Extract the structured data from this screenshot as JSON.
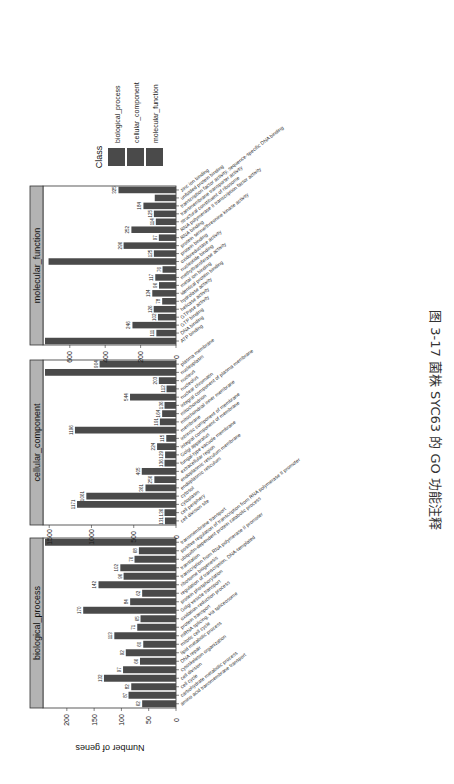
{
  "caption": "图 3-17   菌株 SYC63 的 GO 功能注释",
  "chart_data": {
    "type": "bar",
    "title": "",
    "ylabel": "Number of genes",
    "xlabel": "",
    "orientation_note": "figure rotated 90° clockwise on page",
    "legend": {
      "title": "Class",
      "entries": [
        "biological_process",
        "cellular_component",
        "molecular_function"
      ],
      "position": "right"
    },
    "bar_color": "#4a4a4a",
    "strip_color": "#b3b3b3",
    "panels": [
      {
        "name": "biological_process",
        "ylim": [
          0,
          240
        ],
        "yticks": [
          0,
          50,
          100,
          150,
          200
        ],
        "categories": [
          "amino acid transmembrane transport",
          "carbohydrate metabolic process",
          "cell cycle",
          "cell division",
          "cytoskeleton organization",
          "DNA repair",
          "lipid metabolic process",
          "mitotic cell cycle",
          "mRNA splicing, via spliceosome",
          "protein transport",
          "oxidation-reduction process",
          "Golgi vesicle transport",
          "protein phosphorylation",
          "regulation of transcription, DNA-templated",
          "ribosome biogenesis",
          "transcription from RNA polymerase II promoter",
          "translation",
          "ubiquitin-dependent protein catabolic process",
          "positive regulation of transcription from RNA polymerase II promoter",
          "transmembrane transport"
        ],
        "values": [
          62,
          87,
          82,
          132,
          97,
          66,
          92,
          60,
          113,
          71,
          65,
          170,
          84,
          62,
          142,
          96,
          102,
          76,
          68,
          240
        ],
        "labels": [
          "62",
          "87",
          "82",
          "132",
          "97",
          "66",
          "92",
          "60",
          "113",
          "71",
          "65",
          "170",
          "84",
          "62",
          "142",
          "96",
          "102",
          "76",
          "68",
          ""
        ]
      },
      {
        "name": "cellular_component",
        "ylim": [
          0,
          1550
        ],
        "yticks": [
          0,
          500,
          1000,
          1500
        ],
        "categories": [
          "cell division site",
          "cell periphery",
          "cytoplasm",
          "cytosol",
          "endoplasmic reticulum",
          "endoplasmic reticulum membrane",
          "extracellular region",
          "fungal-type vacuole membrane",
          "Golgi apparatus",
          "integral component of membrane",
          "intrinsic component of membrane",
          "membrane",
          "mitochondrial inner membrane",
          "mitochondrion",
          "integral component of plasma membrane",
          "nuclear chromatin",
          "nucleolus",
          "nucleus",
          "nucleoplasm",
          "plasma membrane"
        ],
        "values": [
          131,
          136,
          1171,
          1061,
          361,
          256,
          405,
          136,
          129,
          224,
          115,
          1196,
          191,
          164,
          136,
          544,
          112,
          203,
          1550,
          904
        ],
        "labels": [
          "131",
          "136",
          "1171",
          "1061",
          "361",
          "256",
          "405",
          "136",
          "129",
          "224",
          "115",
          "1196",
          "191",
          "164",
          "136",
          "544",
          "112",
          "203",
          "",
          "904"
        ]
      },
      {
        "name": "molecular_function",
        "ylim": [
          0,
          740
        ],
        "yticks": [
          0,
          200,
          400,
          600
        ],
        "categories": [
          "ATP binding",
          "DNA binding",
          "GTP binding",
          "GTPase activity",
          "helicase activity",
          "hydrolase activity",
          "identical protein binding",
          "metal ion binding",
          "methyltransferase activity",
          "nucleotide binding",
          "oxidoreductase activity",
          "protein binding",
          "protein serine/threonine kinase activity",
          "RNA binding",
          "RNA polymerase II transcription factor activity",
          "structural constituent of ribosome",
          "transmembrane transporter activity",
          "transcription factor activity, sequence-specific DNA binding",
          "unfolded protein binding",
          "zinc ion binding"
        ],
        "values": [
          740,
          111,
          246,
          102,
          126,
          78,
          134,
          96,
          117,
          76,
          720,
          125,
          296,
          97,
          252,
          114,
          125,
          184,
          120,
          325
        ],
        "labels": [
          "",
          "111",
          "246",
          "102",
          "126",
          "78",
          "134",
          "96",
          "117",
          "76",
          "",
          "125",
          "296",
          "97",
          "252",
          "114",
          "125",
          "184",
          "",
          "325"
        ]
      }
    ]
  }
}
